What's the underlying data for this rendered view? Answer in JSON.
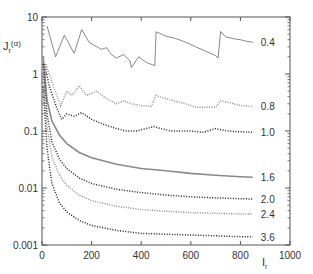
{
  "chart_data": {
    "type": "line",
    "title": "",
    "xlabel": "I_r",
    "ylabel": "J_r^(α)",
    "xlim": [
      0,
      1000
    ],
    "ylim": [
      0.001,
      10
    ],
    "yscale": "log",
    "grid": false,
    "legend": "inline labels at right end of each curve",
    "x_ticks": [
      "0",
      "200",
      "400",
      "600",
      "800",
      "1000"
    ],
    "y_ticks": [
      "0.001",
      "0.01",
      "0.1",
      "1",
      "10"
    ],
    "series": [
      {
        "name": "0.4",
        "style": "thin gray line with points",
        "x": [
          20,
          55,
          90,
          100,
          130,
          160,
          190,
          210,
          240,
          260,
          280,
          300,
          330,
          355,
          360,
          390,
          420,
          455,
          460,
          500,
          540,
          580,
          620,
          660,
          700,
          710,
          720,
          740,
          760,
          780,
          800,
          820,
          850
        ],
        "y": [
          7.0,
          2.0,
          4.8,
          4.0,
          2.3,
          6.0,
          3.6,
          3.2,
          2.7,
          2.9,
          2.2,
          1.9,
          2.2,
          1.7,
          1.3,
          2.0,
          1.6,
          1.4,
          5.5,
          4.6,
          4.2,
          3.6,
          3.0,
          2.5,
          2.1,
          1.9,
          5.6,
          4.5,
          4.3,
          4.1,
          4.0,
          3.8,
          3.6
        ]
      },
      {
        "name": "0.8",
        "style": "gray dotted",
        "x": [
          15,
          50,
          75,
          100,
          120,
          150,
          180,
          220,
          260,
          300,
          330,
          360,
          400,
          440,
          460,
          500,
          540,
          580,
          620,
          660,
          700,
          720,
          760,
          800,
          850
        ],
        "y": [
          1.5,
          0.55,
          0.28,
          0.5,
          0.42,
          0.62,
          0.42,
          0.5,
          0.37,
          0.3,
          0.34,
          0.3,
          0.28,
          0.27,
          0.42,
          0.37,
          0.33,
          0.3,
          0.26,
          0.26,
          0.26,
          0.34,
          0.31,
          0.28,
          0.27
        ]
      },
      {
        "name": "1.0",
        "style": "black dotted",
        "x": [
          10,
          30,
          60,
          80,
          100,
          130,
          160,
          200,
          250,
          300,
          340,
          380,
          420,
          450,
          480,
          520,
          560,
          600,
          650,
          700,
          750,
          800,
          850
        ],
        "y": [
          1.5,
          0.6,
          0.25,
          0.16,
          0.2,
          0.18,
          0.21,
          0.16,
          0.13,
          0.11,
          0.1,
          0.1,
          0.11,
          0.12,
          0.11,
          0.1,
          0.1,
          0.1,
          0.095,
          0.11,
          0.1,
          0.097,
          0.095
        ]
      },
      {
        "name": "1.6",
        "style": "gray solid dense points",
        "x": [
          5,
          20,
          40,
          70,
          100,
          150,
          200,
          300,
          400,
          500,
          600,
          700,
          800,
          850
        ],
        "y": [
          2.0,
          0.35,
          0.15,
          0.085,
          0.06,
          0.042,
          0.034,
          0.026,
          0.022,
          0.02,
          0.018,
          0.0168,
          0.0158,
          0.0155
        ]
      },
      {
        "name": "2.0",
        "style": "black dotted",
        "x": [
          5,
          20,
          40,
          70,
          100,
          150,
          200,
          300,
          400,
          500,
          600,
          700,
          800,
          850
        ],
        "y": [
          1.5,
          0.2,
          0.065,
          0.032,
          0.022,
          0.015,
          0.012,
          0.0095,
          0.0083,
          0.0075,
          0.007,
          0.0067,
          0.0065,
          0.0064
        ]
      },
      {
        "name": "2.4",
        "style": "gray dotted",
        "x": [
          5,
          20,
          40,
          70,
          100,
          150,
          200,
          300,
          400,
          500,
          600,
          700,
          800,
          850
        ],
        "y": [
          1.0,
          0.12,
          0.035,
          0.017,
          0.011,
          0.0075,
          0.006,
          0.0048,
          0.0042,
          0.0039,
          0.0037,
          0.0036,
          0.0035,
          0.0035
        ]
      },
      {
        "name": "3.6",
        "style": "black dotted",
        "x": [
          5,
          20,
          40,
          70,
          100,
          150,
          200,
          300,
          400,
          500,
          600,
          700,
          800,
          850
        ],
        "y": [
          0.6,
          0.05,
          0.012,
          0.0055,
          0.0038,
          0.0027,
          0.0022,
          0.0018,
          0.0016,
          0.00155,
          0.0015,
          0.00145,
          0.0014,
          0.0014
        ]
      }
    ]
  },
  "labels": {
    "y_axis_label_main": "J",
    "y_axis_label_sub": "r",
    "y_axis_label_sup": "(α)",
    "x_axis_label_main": "I",
    "x_axis_label_sub": "r"
  }
}
